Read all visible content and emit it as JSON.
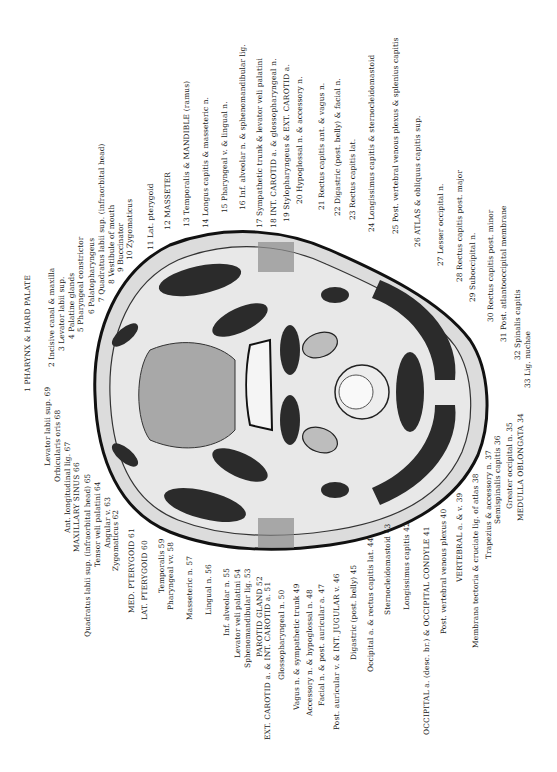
{
  "figure": {
    "orientation": "rotated 90deg; labels read bottom-to-top",
    "colors": {
      "background": "#ffffff",
      "skin": "#d9d9d9",
      "muscle": "#2b2b2b",
      "fat": "#e6e6e6",
      "outline": "#111111",
      "text": "#1a1a1a"
    }
  },
  "labels_right": [
    {
      "n": 1,
      "text": "1 PHARYNX & HARD PALATE"
    },
    {
      "n": 2,
      "text": "2 Incisive canal & maxilla"
    },
    {
      "n": 3,
      "text": "3 Levator labii sup."
    },
    {
      "n": 4,
      "text": "4 Palatine glands"
    },
    {
      "n": 5,
      "text": "5 Pharyngeal constrictor"
    },
    {
      "n": 6,
      "text": "6 Palatopharyngeus"
    },
    {
      "n": 7,
      "text": "7 Quadratus labii sup. (infraorbital head)"
    },
    {
      "n": 8,
      "text": "8 Vestibule of mouth"
    },
    {
      "n": 9,
      "text": "9 Buccinator"
    },
    {
      "n": 10,
      "text": "10 Zygomaticus"
    },
    {
      "n": 11,
      "text": "11 Lat. pterygoid"
    },
    {
      "n": 12,
      "text": "12 MASSETER"
    },
    {
      "n": 13,
      "text": "13 Temporalis & MANDIBLE (ramus)"
    },
    {
      "n": 14,
      "text": "14 Longus capitis & masseteric n."
    },
    {
      "n": 15,
      "text": "15 Pharyngeal v. & lingual n."
    },
    {
      "n": 16,
      "text": "16 Inf. alveolar n. & sphenomandibular lig."
    },
    {
      "n": 17,
      "text": "17 Sympathetic trunk & levator veli palatini"
    },
    {
      "n": 18,
      "text": "18 INT. CAROTID a. & glossopharyngeal n."
    },
    {
      "n": 19,
      "text": "19 Stylopharyngeus & EXT. CAROTID a."
    },
    {
      "n": 20,
      "text": "20 Hypoglossal n. & accessory n."
    },
    {
      "n": 21,
      "text": "21 Rectus capitis ant. & vagus n."
    },
    {
      "n": 22,
      "text": "22 Digastric (post. belly) & facial n."
    },
    {
      "n": 23,
      "text": "23 Rectus capitis lat."
    },
    {
      "n": 24,
      "text": "24 Longissimus capitis & sternocleidomastoid"
    },
    {
      "n": 25,
      "text": "25 Post. vertebral venous plexus & splenius capitis"
    },
    {
      "n": 26,
      "text": "26 ATLAS & obliquus capitis sup."
    },
    {
      "n": 27,
      "text": "27 Lesser occipital n."
    },
    {
      "n": 28,
      "text": "28 Rectus capitis post. major"
    },
    {
      "n": 29,
      "text": "29 Suboccipital n."
    },
    {
      "n": 30,
      "text": "30 Rectus capitis post. minor"
    },
    {
      "n": 31,
      "text": "31 Post. atlantooccipital membrane"
    },
    {
      "n": 32,
      "text": "32 Spinalis capitis"
    },
    {
      "n": 33,
      "text": "33 Lig. nuchae"
    }
  ],
  "labels_left": [
    {
      "n": 34,
      "text": "MEDULLA OBLONGATA 34"
    },
    {
      "n": 35,
      "text": "Greater occipital n. 35"
    },
    {
      "n": 36,
      "text": "Semispinalis capitis 36"
    },
    {
      "n": 37,
      "text": "Trapezius & accessory n. 37"
    },
    {
      "n": 38,
      "text": "Membrana tectoria & cruciate lig. of atlas 38"
    },
    {
      "n": 39,
      "text": "VERTEBRAL a. & v. 39"
    },
    {
      "n": 40,
      "text": "Post. vertebral venous plexus 40"
    },
    {
      "n": 41,
      "text": "OCCIPITAL a. (desc. br.) & OCCIPITAL CONDYLE 41"
    },
    {
      "n": 42,
      "text": "Longissimus capitis 42"
    },
    {
      "n": 43,
      "text": "Sternocleidomastoid 43"
    },
    {
      "n": 44,
      "text": "Occipital a. & rectus capitis lat. 44"
    },
    {
      "n": 45,
      "text": "Digastric (post. belly) 45"
    },
    {
      "n": 46,
      "text": "Post. auricular v. & INT. JUGULAR v. 46"
    },
    {
      "n": 47,
      "text": "Facial n. & post. auricular a. 47"
    },
    {
      "n": 48,
      "text": "Accessory n. & hypoglossal n. 48"
    },
    {
      "n": 49,
      "text": "Vagus n. & sympathetic trunk 49"
    },
    {
      "n": 50,
      "text": "Glossopharyngeal n. 50"
    },
    {
      "n": 51,
      "text": "EXT. CAROTID a. & INT. CAROTID a. 51"
    },
    {
      "n": 52,
      "text": "PAROTID GLAND 52"
    },
    {
      "n": 53,
      "text": "Sphenomandibular lig. 53"
    },
    {
      "n": 54,
      "text": "Levator veli palatini 54"
    },
    {
      "n": 55,
      "text": "Inf. alveolar n. 55"
    },
    {
      "n": 56,
      "text": "Lingual n. 56"
    },
    {
      "n": 57,
      "text": "Masseteric n. 57"
    },
    {
      "n": 58,
      "text": "Pharyngeal vv. 58"
    },
    {
      "n": 59,
      "text": "Temporalis 59"
    },
    {
      "n": 60,
      "text": "LAT. PTERYGOID 60"
    },
    {
      "n": 61,
      "text": "MED. PTERYGOID 61"
    },
    {
      "n": 62,
      "text": "Zygomaticus 62"
    },
    {
      "n": 63,
      "text": "Angular v. 63"
    },
    {
      "n": 64,
      "text": "Tensor veli palatini 64"
    },
    {
      "n": 65,
      "text": "Quadratus labii sup. (infraorbital head) 65"
    },
    {
      "n": 66,
      "text": "MAXILLARY SINUS 66"
    },
    {
      "n": 67,
      "text": "Ant. longitudinal lig. 67"
    },
    {
      "n": 68,
      "text": "Orbicularis oris 68"
    },
    {
      "n": 69,
      "text": "Levator labii sup. 69"
    }
  ]
}
